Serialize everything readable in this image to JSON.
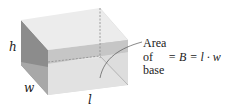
{
  "diagram": {
    "labels": {
      "height": "h",
      "width": "w",
      "length": "l"
    },
    "annotation": {
      "line1": "Area",
      "line2": "of",
      "line3": "base",
      "formula": "= B = l · w"
    },
    "colors": {
      "top_face": "#ececec",
      "left_face": "#8a8a8a",
      "left_face_lower": "#a6a6a6",
      "front_face": "#e2e2e2",
      "front_band": "#c4c4c4",
      "right_face": "#c8c8c8",
      "right_face_lower": "#b3b3b3",
      "base_face": "#dadada",
      "dashed_edge": "#8c8c8c",
      "text": "#222222"
    }
  }
}
